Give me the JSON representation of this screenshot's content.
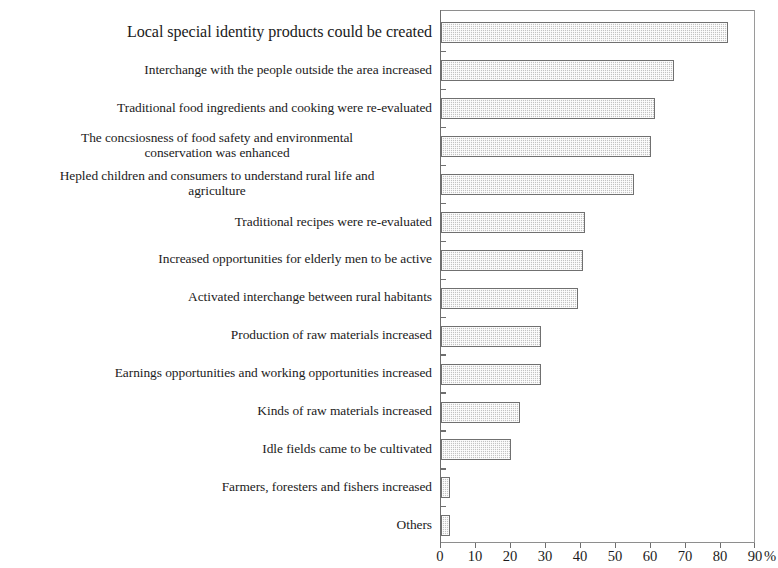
{
  "chart_data": {
    "type": "bar",
    "orientation": "horizontal",
    "title": "",
    "xlabel": "%",
    "ylabel": "",
    "xlim": [
      0,
      90
    ],
    "xticks": [
      0,
      10,
      20,
      30,
      40,
      50,
      60,
      70,
      80,
      90
    ],
    "xtick_labels": [
      "0",
      "10",
      "20",
      "30",
      "40",
      "50",
      "60",
      "70",
      "80",
      "90"
    ],
    "x_unit_suffix": "%",
    "grid": false,
    "legend": null,
    "bar_fill_color": "#c3c3c3",
    "bar_edge_color": "#707070",
    "axis_color": "#6e6e6e",
    "categories": [
      "Local special identity products could be created",
      "Interchange with the people outside the area increased",
      "Traditional food ingredients and cooking were re-evaluated",
      "The concsiosness of food safety and environmental\nconservation was enhanced",
      "Hepled children and consumers to understand rural life and\nagriculture",
      "Traditional recipes were re-evaluated",
      "Increased opportunities for elderly men to be active",
      "Activated interchange between rural habitants",
      "Production of raw materials increased",
      "Earnings opportunities and working opportunities increased",
      "Kinds of raw materials increased",
      "Idle fields came to be cultivated",
      "Farmers, foresters and fishers increased",
      "Others"
    ],
    "values": [
      82,
      66.5,
      61,
      60,
      55,
      41,
      40.5,
      39,
      28.5,
      28.5,
      22.5,
      20,
      2.5,
      2.5
    ]
  }
}
